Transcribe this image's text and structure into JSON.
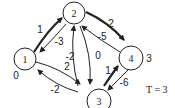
{
  "graph": {
    "nodes": [
      {
        "id": "1",
        "label": "1",
        "value": "0"
      },
      {
        "id": "2",
        "label": "2",
        "value": ""
      },
      {
        "id": "3",
        "label": "3",
        "value": ""
      },
      {
        "id": "4",
        "label": "4",
        "value": "3"
      }
    ],
    "edges": [
      {
        "from": "1",
        "to": "2",
        "weight": "1",
        "bold": true
      },
      {
        "from": "2",
        "to": "1",
        "weight": "-3",
        "bold": false
      },
      {
        "from": "2",
        "to": "4",
        "weight": "2",
        "bold": true
      },
      {
        "from": "4",
        "to": "2",
        "weight": "-5",
        "bold": false
      },
      {
        "from": "3",
        "to": "2",
        "weight": "-2",
        "bold": false
      },
      {
        "from": "2",
        "to": "3",
        "weight": "0",
        "bold": false
      },
      {
        "from": "1",
        "to": "3",
        "weight": "2",
        "bold": false
      },
      {
        "from": "3",
        "to": "1",
        "weight": "-2",
        "bold": false
      },
      {
        "from": "3",
        "to": "4",
        "weight": "1",
        "bold": true
      },
      {
        "from": "4",
        "to": "3",
        "weight": "-6",
        "bold": false
      }
    ],
    "t_label": "T = 3"
  }
}
